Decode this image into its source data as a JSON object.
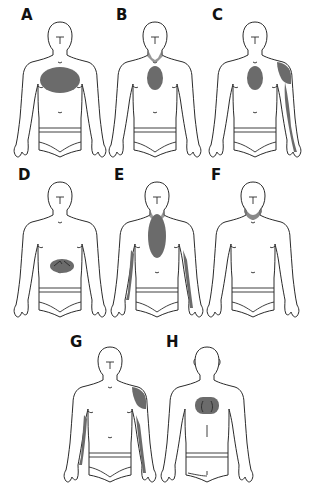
{
  "diagram": {
    "type": "body-pain-distribution-figures",
    "shade_color": "#6b6b6b",
    "outline_color": "#2a2a2a",
    "background": "#ffffff",
    "panels": [
      {
        "label": "A",
        "view": "front",
        "regions": [
          "chest-wide"
        ]
      },
      {
        "label": "B",
        "view": "front",
        "regions": [
          "mid-chest-oval",
          "neck"
        ]
      },
      {
        "label": "C",
        "view": "front",
        "regions": [
          "mid-chest-oval",
          "left-shoulder",
          "left-arm-inner"
        ]
      },
      {
        "label": "D",
        "view": "front",
        "regions": [
          "epigastric"
        ]
      },
      {
        "label": "E",
        "view": "front",
        "regions": [
          "neck",
          "sternum-long",
          "both-arms-inner"
        ]
      },
      {
        "label": "F",
        "view": "front",
        "regions": [
          "jaw-neck"
        ]
      },
      {
        "label": "G",
        "view": "front",
        "regions": [
          "left-shoulder",
          "both-arms-inner"
        ]
      },
      {
        "label": "H",
        "view": "back",
        "regions": [
          "interscapular"
        ]
      }
    ]
  }
}
